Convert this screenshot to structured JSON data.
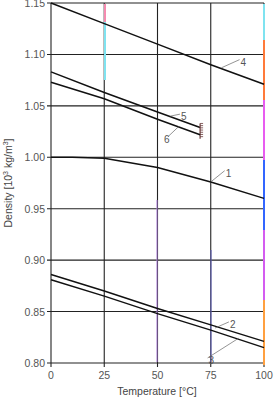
{
  "chart_data": {
    "type": "line",
    "title": "",
    "xlabel": "Temperature [°C]",
    "ylabel": "Density [10³ kg/m³]",
    "ylabel_parts": {
      "main": "Density [10",
      "sup": "3",
      "mid": " kg/m",
      "sup2": "3",
      "end": "]"
    },
    "xlim": [
      0,
      100
    ],
    "ylim": [
      0.8,
      1.15
    ],
    "x_ticks": [
      0,
      25,
      50,
      75,
      100
    ],
    "x_tick_labels": [
      "0",
      "25",
      "50",
      "75",
      "100"
    ],
    "y_ticks": [
      0.8,
      0.85,
      0.9,
      0.95,
      1.0,
      1.05,
      1.1,
      1.15
    ],
    "y_tick_labels": [
      "0.80",
      "0.85",
      "0.90",
      "0.95",
      "1.00",
      "1.05",
      "1.10",
      "1.15"
    ],
    "grid": true,
    "legend": "inline numeric labels on curves",
    "series": [
      {
        "name": "1",
        "x": [
          0,
          10,
          25,
          50,
          75,
          100
        ],
        "values": [
          1.0,
          1.0,
          0.999,
          0.99,
          0.976,
          0.96
        ],
        "label_at": {
          "x": 82,
          "y": 0.985
        }
      },
      {
        "name": "2",
        "x": [
          0,
          25,
          50,
          75,
          100
        ],
        "values": [
          0.886,
          0.87,
          0.853,
          0.837,
          0.821
        ],
        "label_at": {
          "x": 84,
          "y": 0.838
        }
      },
      {
        "name": "3",
        "x": [
          0,
          25,
          50,
          75,
          100
        ],
        "values": [
          0.881,
          0.865,
          0.848,
          0.832,
          0.815
        ],
        "label_at": {
          "x": 74,
          "y": 0.803
        }
      },
      {
        "name": "4",
        "x": [
          0,
          25,
          50,
          75,
          100
        ],
        "values": [
          1.15,
          1.13,
          1.11,
          1.09,
          1.071
        ],
        "label_at": {
          "x": 89,
          "y": 1.093
        }
      },
      {
        "name": "5",
        "x": [
          0,
          25,
          50,
          70
        ],
        "values": [
          1.083,
          1.063,
          1.044,
          1.029
        ],
        "end_marker": "hatched",
        "label_at": {
          "x": 61,
          "y": 1.04
        }
      },
      {
        "name": "6",
        "x": [
          0,
          25,
          50,
          70
        ],
        "values": [
          1.073,
          1.057,
          1.037,
          1.022
        ],
        "label_at": {
          "x": 53,
          "y": 1.018
        }
      }
    ]
  },
  "footer_fragment": "a) Water"
}
